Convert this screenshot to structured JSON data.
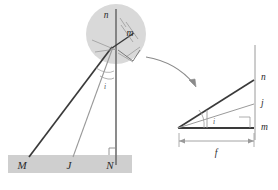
{
  "figure": {
    "background_color": "#ffffff",
    "colors": {
      "baseline_fill": "#cfcfcf",
      "magnifier_fill": "#d9d9d9",
      "heavy_line": "#3a3a3a",
      "light_line": "#9a9a9a",
      "medium_line": "#6f6f6f",
      "label": "#2b2b2b",
      "small_label": "#555555"
    }
  },
  "main_diagram": {
    "name": "main-ray-diagram",
    "baseline": {
      "name": "ground-bar",
      "labels": [
        {
          "id": "M",
          "text": "M",
          "x": 22,
          "y": 169
        },
        {
          "id": "J",
          "text": "J",
          "x": 69,
          "y": 169
        },
        {
          "id": "N",
          "text": "N",
          "x": 110,
          "y": 169
        }
      ]
    },
    "apex_labels": [
      {
        "id": "n",
        "text": "n",
        "x": 106,
        "y": 18
      },
      {
        "id": "m",
        "text": "m",
        "x": 130,
        "y": 36
      },
      {
        "id": "i",
        "text": "i",
        "x": 105,
        "y": 89
      }
    ],
    "right_angle_marker": {
      "name": "right-angle-marker-N",
      "x": 116,
      "y": 146
    }
  },
  "magnifier": {
    "name": "magnifier-circle",
    "center_x": 116,
    "center_y": 34,
    "radius": 30
  },
  "callout_arrow": {
    "name": "callout-arrow",
    "from_x": 146,
    "from_y": 58,
    "to_x": 196,
    "to_y": 86
  },
  "detail_diagram": {
    "name": "detail-angle-diagram",
    "vertex_x": 178,
    "vertex_y": 128,
    "axis_x": 255,
    "labels": [
      {
        "id": "n",
        "text": "n",
        "x": 259,
        "y": 80
      },
      {
        "id": "j",
        "text": "j",
        "x": 260,
        "y": 105
      },
      {
        "id": "m",
        "text": "m",
        "x": 259,
        "y": 129
      },
      {
        "id": "i",
        "text": "i",
        "x": 214,
        "y": 124
      }
    ],
    "dimension": {
      "name": "dimension-f",
      "label": "f",
      "label_x": 216,
      "label_y": 155,
      "left_x": 179,
      "right_x": 254,
      "y": 141
    },
    "right_angle_marker": {
      "name": "right-angle-marker-detail",
      "x": 239,
      "y": 117
    }
  }
}
